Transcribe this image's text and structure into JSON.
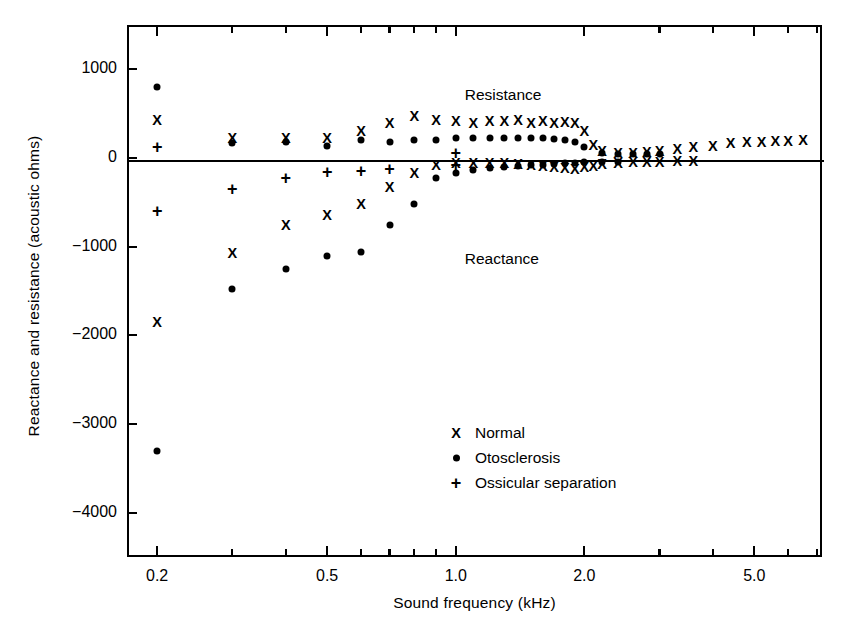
{
  "chart_data": {
    "type": "scatter",
    "title": "",
    "xlabel": "Sound frequency (kHz)",
    "ylabel": "Reactance and resistance (acoustic ohms)",
    "xscale": "log",
    "xlim": [
      0.17,
      7.2
    ],
    "ylim": [
      -4500,
      1500
    ],
    "grid": false,
    "legend_position": "lower-center-right",
    "xticks_labeled": [
      "0.2",
      "0.5",
      "1.0",
      "2.0",
      "5.0"
    ],
    "xtick_values_labeled": [
      0.2,
      0.5,
      1.0,
      2.0,
      5.0
    ],
    "xticks_minor": [
      0.3,
      0.4,
      0.6,
      0.7,
      0.8,
      0.9,
      3.0,
      4.0,
      6.0,
      7.0
    ],
    "yticks": [
      1000,
      0,
      -1000,
      -2000,
      -3000,
      -4000
    ],
    "ytick_labels": [
      "1000",
      "0",
      "-1000",
      "-2000",
      "-3000",
      "-4000"
    ],
    "annotations": [
      {
        "text": "Resistance",
        "x": 1.05,
        "y": 700
      },
      {
        "text": "Reactance",
        "x": 1.05,
        "y": -1150
      }
    ],
    "series": [
      {
        "name": "Normal",
        "marker": "x",
        "resistance": {
          "x": [
            0.2,
            0.3,
            0.4,
            0.5,
            0.6,
            0.7,
            0.8,
            0.9,
            1.0,
            1.1,
            1.2,
            1.3,
            1.4,
            1.5,
            1.6,
            1.7,
            1.8,
            1.9,
            2.0,
            2.1,
            2.2,
            2.4,
            2.6,
            2.8,
            3.0,
            3.3,
            3.6,
            4.0,
            4.4,
            4.8,
            5.2,
            5.6,
            6.0,
            6.5
          ],
          "y": [
            430,
            220,
            220,
            230,
            300,
            400,
            470,
            430,
            420,
            400,
            420,
            420,
            430,
            400,
            420,
            400,
            410,
            400,
            300,
            150,
            80,
            60,
            60,
            70,
            80,
            100,
            120,
            140,
            170,
            180,
            180,
            190,
            190,
            200
          ]
        },
        "reactance": {
          "x": [
            0.2,
            0.3,
            0.4,
            0.5,
            0.6,
            0.7,
            0.8,
            0.9,
            1.0,
            1.1,
            1.2,
            1.3,
            1.4,
            1.5,
            1.6,
            1.7,
            1.8,
            1.9,
            2.0,
            2.1,
            2.2,
            2.4,
            2.6,
            2.8,
            3.0,
            3.3,
            3.6
          ],
          "y": [
            -1850,
            -1070,
            -750,
            -640,
            -520,
            -330,
            -170,
            -80,
            -60,
            -60,
            -60,
            -60,
            -70,
            -80,
            -90,
            -100,
            -110,
            -120,
            -100,
            -90,
            -70,
            -60,
            -50,
            -40,
            -40,
            -30,
            -30
          ]
        }
      },
      {
        "name": "Otosclerosis",
        "marker": "dot",
        "resistance": {
          "x": [
            0.2,
            0.3,
            0.4,
            0.5,
            0.6,
            0.7,
            0.8,
            0.9,
            1.0,
            1.1,
            1.2,
            1.3,
            1.4,
            1.5,
            1.6,
            1.7,
            1.8,
            1.9,
            2.0,
            2.2,
            2.4,
            2.6,
            2.8,
            3.0
          ],
          "y": [
            800,
            170,
            180,
            130,
            200,
            180,
            200,
            200,
            230,
            230,
            230,
            230,
            230,
            220,
            220,
            210,
            200,
            180,
            120,
            60,
            50,
            40,
            40,
            40
          ]
        },
        "reactance": {
          "x": [
            0.2,
            0.3,
            0.4,
            0.5,
            0.6,
            0.7,
            0.8,
            0.9,
            1.0,
            1.1,
            1.2,
            1.3,
            1.4,
            1.5,
            1.6,
            1.7,
            1.8,
            1.9,
            2.0,
            2.2,
            2.4
          ],
          "y": [
            -3300,
            -1480,
            -1250,
            -1100,
            -1060,
            -750,
            -520,
            -230,
            -170,
            -130,
            -110,
            -100,
            -90,
            -80,
            -80,
            -70,
            -60,
            -60,
            -50,
            -40,
            -40
          ]
        }
      },
      {
        "name": "Ossicular separation",
        "marker": "plus",
        "resistance": {
          "x": [
            0.2,
            1.0
          ],
          "y": [
            120,
            60
          ]
        },
        "reactance": {
          "x": [
            0.2,
            0.3,
            0.4,
            0.5,
            0.6,
            0.7,
            1.0
          ],
          "y": [
            -600,
            -350,
            -220,
            -160,
            -150,
            -120,
            -80
          ]
        }
      }
    ]
  },
  "legend": {
    "items": [
      {
        "marker": "x",
        "label": "Normal"
      },
      {
        "marker": "dot",
        "label": "Otosclerosis"
      },
      {
        "marker": "plus",
        "label": "Ossicular separation"
      }
    ]
  }
}
